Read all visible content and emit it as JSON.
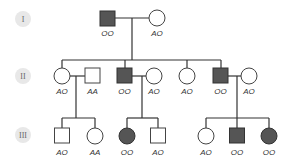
{
  "generations": [
    {
      "label": "I",
      "y": 19
    },
    {
      "label": "II",
      "y": 76
    },
    {
      "label": "III",
      "y": 135
    }
  ],
  "individuals": {
    "I1": {
      "sex": "male",
      "affected": true,
      "genotype": "OO"
    },
    "I2": {
      "sex": "female",
      "affected": false,
      "genotype": "AO"
    },
    "II1": {
      "sex": "female",
      "affected": false,
      "genotype": "AO"
    },
    "II2": {
      "sex": "male",
      "affected": false,
      "genotype": "AA"
    },
    "II3": {
      "sex": "male",
      "affected": true,
      "genotype": "OO"
    },
    "II4": {
      "sex": "female",
      "affected": false,
      "genotype": "AO"
    },
    "II5": {
      "sex": "female",
      "affected": false,
      "genotype": "AO"
    },
    "II6": {
      "sex": "male",
      "affected": true,
      "genotype": "OO"
    },
    "II7": {
      "sex": "female",
      "affected": false,
      "genotype": "AO"
    },
    "III1": {
      "sex": "male",
      "affected": false,
      "genotype": "AO"
    },
    "III2": {
      "sex": "female",
      "affected": false,
      "genotype": "AA"
    },
    "III3": {
      "sex": "female",
      "affected": true,
      "genotype": "OO"
    },
    "III4": {
      "sex": "male",
      "affected": false,
      "genotype": "AO"
    },
    "III5": {
      "sex": "female",
      "affected": false,
      "genotype": "AO"
    },
    "III6": {
      "sex": "male",
      "affected": true,
      "genotype": "OO"
    },
    "III7": {
      "sex": "female",
      "affected": true,
      "genotype": "OO"
    }
  },
  "colors": {
    "affected_fill": "#555555",
    "unaffected_fill": "#ffffff",
    "line": "#333333",
    "badge": "#e8e8e8"
  }
}
